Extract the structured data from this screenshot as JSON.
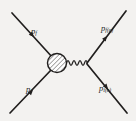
{
  "figure": {
    "kind": "feynman-diagram",
    "background_color": "#f3f2f0",
    "ink_color": "#211f1e",
    "width": 136,
    "height": 121
  },
  "labels": {
    "upper_left": {
      "symbol": "p",
      "subscript": "f",
      "paren": ""
    },
    "upper_right": {
      "symbol": "p",
      "subscript": "f",
      "paren": "(e)"
    },
    "lower_left": {
      "symbol": "p",
      "subscript": "i",
      "paren": ""
    },
    "lower_right": {
      "symbol": "p",
      "subscript": "i",
      "paren": "(e)"
    }
  },
  "lines": [
    {
      "name": "incoming-fermion-upper-left",
      "from": [
        12,
        13
      ],
      "to": [
        52,
        57
      ],
      "arrow_direction": "toward-vertex",
      "arrow_at": [
        31,
        34
      ]
    },
    {
      "name": "incoming-fermion-lower-left",
      "from": [
        10,
        113
      ],
      "to": [
        52,
        69
      ],
      "arrow_direction": "toward-vertex",
      "arrow_at": [
        30,
        92
      ]
    },
    {
      "name": "outgoing-fermion-upper-right",
      "from": [
        88,
        62
      ],
      "to": [
        126,
        11
      ],
      "arrow_direction": "away-from-vertex",
      "arrow_at": [
        106,
        36
      ]
    },
    {
      "name": "outgoing-fermion-lower-right",
      "from": [
        88,
        64
      ],
      "to": [
        127,
        112
      ],
      "arrow_direction": "away-from-vertex",
      "arrow_at": [
        107,
        88
      ]
    }
  ],
  "blob": {
    "name": "hatched-vertex-blob",
    "center": [
      57,
      63
    ],
    "radius": 9.5,
    "fill_pattern": "diagonal-hatching",
    "hatch_angle_deg": 45
  },
  "propagator": {
    "name": "photon-wavy-line",
    "from": [
      67,
      63
    ],
    "to": [
      88,
      63
    ],
    "oscillations": 7,
    "amplitude": 4
  }
}
